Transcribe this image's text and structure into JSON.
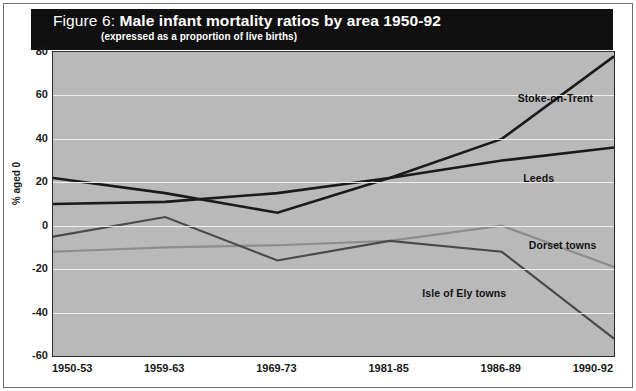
{
  "figure": {
    "label": "Figure 6:",
    "title": "Male infant mortality ratios by area 1950-92",
    "subtitle": "(expressed as a proportion of live births)"
  },
  "colors": {
    "plot_background": "#b9b9b9",
    "banner": "#101010",
    "gridline": "#ededed",
    "stoke": "#1a1a1a",
    "leeds": "#1a1a1a",
    "isle_of_ely": "#4a4a4a",
    "dorset": "#8d8d8d"
  },
  "chart_data": {
    "type": "line",
    "title": "Male infant mortality ratios by area 1950-92",
    "subtitle": "(expressed as a proportion of live births)",
    "xlabel": "",
    "ylabel": "% aged 0",
    "categories": [
      "1950-53",
      "1959-63",
      "1969-73",
      "1981-85",
      "1986-89",
      "1990-92"
    ],
    "ylim": [
      -60,
      80
    ],
    "yticks": [
      80,
      60,
      40,
      20,
      0,
      -20,
      -40,
      -60
    ],
    "grid": true,
    "legend": "inline-annotations",
    "series": [
      {
        "name": "Stoke-on-Trent",
        "color": "#1a1a1a",
        "width": 2.6,
        "values": [
          22,
          15,
          6,
          22,
          40,
          78
        ],
        "label_x_index": 4.15,
        "label_y": 58
      },
      {
        "name": "Leeds",
        "color": "#1a1a1a",
        "width": 2.6,
        "values": [
          10,
          11,
          15,
          22,
          30,
          36
        ],
        "label_x_index": 4.2,
        "label_y": 21
      },
      {
        "name": "Dorset towns",
        "color": "#8d8d8d",
        "width": 2.2,
        "values": [
          -12,
          -10,
          -9,
          -7,
          0,
          -19
        ],
        "label_x_index": 4.25,
        "label_y": -10
      },
      {
        "name": "Isle of Ely towns",
        "color": "#4a4a4a",
        "width": 2.2,
        "values": [
          -5,
          4,
          -16,
          -7,
          -12,
          -52
        ],
        "label_x_index": 3.3,
        "label_y": -32
      }
    ]
  }
}
